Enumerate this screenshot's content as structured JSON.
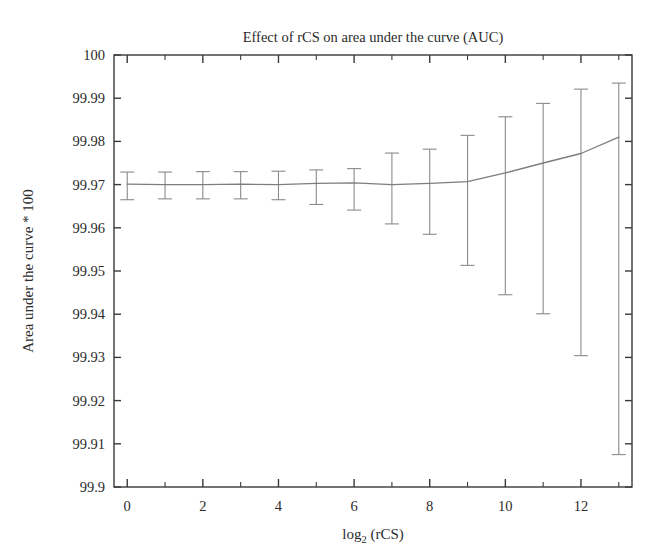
{
  "figure": {
    "title": "Effect of rCS on area under the curve (AUC)",
    "background_color": "#ffffff",
    "axis_color": "#3a3a3a",
    "series_color": "#7d7d7d",
    "errorbar_color": "#8a8a8a",
    "text_color": "#2b2b2b"
  },
  "axes": {
    "x_title_main": "log",
    "x_title_sub": "2",
    "x_title_tail": " (rCS)",
    "x_title_full": "log2 (rCS)",
    "y_title": "Area under the curve * 100",
    "x_tick_labels": [
      "0",
      "2",
      "4",
      "6",
      "8",
      "10",
      "12"
    ],
    "y_tick_labels": [
      "100",
      "99.99",
      "99.98",
      "99.97",
      "99.96",
      "99.95",
      "99.94",
      "99.93",
      "99.92",
      "99.91",
      "99.9"
    ]
  },
  "chart_data": {
    "type": "line",
    "title": "Effect of rCS on area under the curve (AUC)",
    "xlabel": "log2 (rCS)",
    "ylabel": "Area under the curve * 100",
    "xlim": [
      -0.35,
      13.35
    ],
    "ylim": [
      99.9,
      100.0
    ],
    "xticks": [
      0,
      2,
      4,
      6,
      8,
      10,
      12
    ],
    "yticks": [
      99.9,
      99.91,
      99.92,
      99.93,
      99.94,
      99.95,
      99.96,
      99.97,
      99.98,
      99.99,
      100.0
    ],
    "x_minor_ticks": [
      1,
      3,
      5,
      7,
      9,
      11,
      13
    ],
    "grid": false,
    "legend": false,
    "errorbars": true,
    "x": [
      0,
      1,
      2,
      3,
      4,
      5,
      6,
      7,
      8,
      9,
      10,
      11,
      12,
      13
    ],
    "series": [
      {
        "name": "Mean AUC * 100",
        "values": [
          99.9701,
          99.97,
          99.97,
          99.9701,
          99.97,
          99.9703,
          99.9704,
          99.97,
          99.9703,
          99.9707,
          99.9727,
          99.975,
          99.9772,
          99.981
        ],
        "err_low": [
          99.9665,
          99.9667,
          99.9667,
          99.9667,
          99.9665,
          99.9654,
          99.9641,
          99.9609,
          99.9585,
          99.9513,
          99.9445,
          99.9401,
          99.9304,
          99.9075
        ],
        "err_high": [
          99.9729,
          99.9729,
          99.973,
          99.973,
          99.9731,
          99.9734,
          99.9737,
          99.9773,
          99.9782,
          99.9814,
          99.9857,
          99.9888,
          99.9921,
          99.9935
        ]
      }
    ]
  }
}
